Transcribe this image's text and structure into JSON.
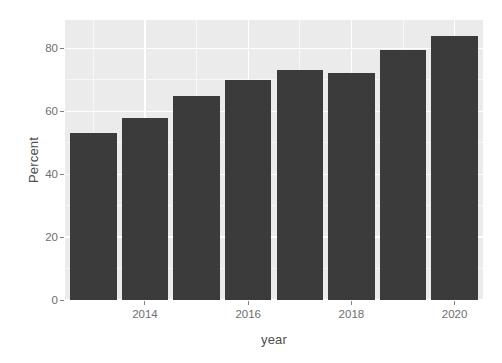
{
  "chart_data": {
    "type": "bar",
    "title": "",
    "subtitle": "",
    "xlabel": "year",
    "ylabel": "Percent",
    "categories": [
      "2013",
      "2014",
      "2015",
      "2016",
      "2017",
      "2018",
      "2019",
      "2020"
    ],
    "values": [
      53.0,
      58.0,
      65.0,
      70.0,
      73.0,
      72.0,
      79.5,
      84.0
    ],
    "x_tick_labels": [
      "2014",
      "2016",
      "2018",
      "2020"
    ],
    "x_tick_values": [
      2014,
      2016,
      2018,
      2020
    ],
    "y_tick_labels": [
      "0",
      "20",
      "40",
      "60",
      "80"
    ],
    "y_tick_values": [
      0,
      20,
      40,
      60,
      80
    ],
    "ylim": [
      0,
      89
    ],
    "xlim": [
      2012.45,
      2020.55
    ],
    "grid": true,
    "legend": false,
    "legend_position": "none",
    "bar_color": "#3b3b3b",
    "panel_background": "#ebebeb",
    "grid_major_color": "#ffffff",
    "grid_minor_color": "#f7f7f7",
    "axis_text_color": "#6e6e6e",
    "axis_title_color": "#4d4d4d"
  }
}
